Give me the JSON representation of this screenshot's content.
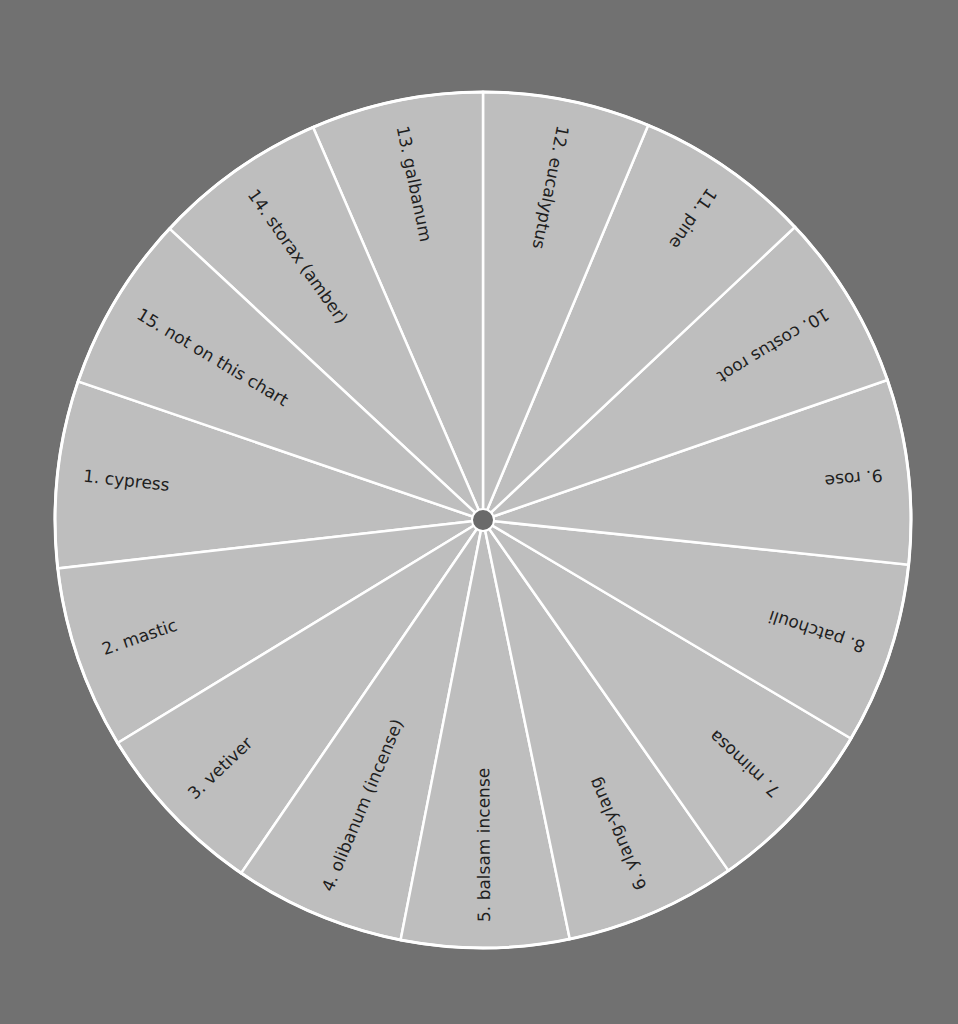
{
  "wheel": {
    "center": [
      483,
      520
    ],
    "radius": 428,
    "hub_radius": 11,
    "colors": {
      "background": "#717171",
      "wedge": "#bebebe",
      "divider": "#ffffff",
      "hub": "#6a6a6a",
      "text": "#1e1e1e"
    },
    "segments": [
      {
        "number": "1.",
        "name": "cypress",
        "label": "1.  cypress",
        "start_deg": 173.5,
        "end_deg": 198.9
      },
      {
        "number": "2.",
        "name": "mastic",
        "label": "2.  mastic",
        "start_deg": 148.6,
        "end_deg": 173.5
      },
      {
        "number": "3.",
        "name": "vetiver",
        "label": "3.  vetiver",
        "start_deg": 124.4,
        "end_deg": 148.6
      },
      {
        "number": "4.",
        "name": "olibanum (incense)",
        "label": "4.  olibanum (incense)",
        "start_deg": 101.1,
        "end_deg": 124.4
      },
      {
        "number": "5.",
        "name": "balsam incense",
        "label": "5.  balsam incense",
        "start_deg": 78.3,
        "end_deg": 101.1
      },
      {
        "number": "6.",
        "name": "ylang-ylang",
        "label": "6.  ylang-ylang",
        "start_deg": 55.0,
        "end_deg": 78.3
      },
      {
        "number": "7.",
        "name": "mimosa",
        "label": "7.  mimosa",
        "start_deg": 30.7,
        "end_deg": 55.0
      },
      {
        "number": "8.",
        "name": "patchouli",
        "label": "8.  patchouli",
        "start_deg": 6.0,
        "end_deg": 30.7
      },
      {
        "number": "9.",
        "name": "rose",
        "label": "9.  rose",
        "start_deg": -19.1,
        "end_deg": 6.0
      },
      {
        "number": "10.",
        "name": "costus root",
        "label": "10.  costus root",
        "start_deg": -43.2,
        "end_deg": -19.1
      },
      {
        "number": "11.",
        "name": "pine",
        "label": "11.  pine",
        "start_deg": -67.3,
        "end_deg": -43.2
      },
      {
        "number": "12.",
        "name": "eucalyptus",
        "label": "12.  eucalyptus",
        "start_deg": -90.0,
        "end_deg": -67.3
      },
      {
        "number": "13.",
        "name": "galbanum",
        "label": "13.  galbanum",
        "start_deg": -113.4,
        "end_deg": -90.0
      },
      {
        "number": "14.",
        "name": "storax (amber)",
        "label": "14.  storax (amber)",
        "start_deg": -137.1,
        "end_deg": -113.4
      },
      {
        "number": "15.",
        "name": "not on this chart",
        "label": "15.  not on this chart",
        "start_deg": -161.1,
        "end_deg": -137.1
      }
    ],
    "label_inset": 26
  }
}
